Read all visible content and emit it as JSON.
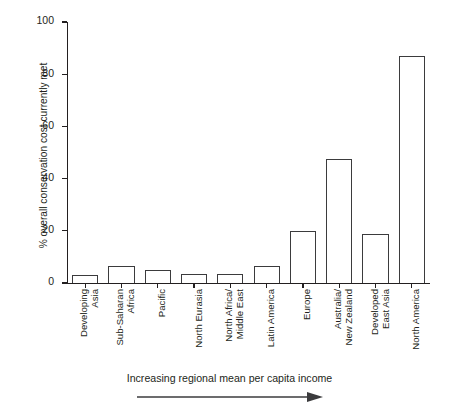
{
  "chart_data": {
    "type": "bar",
    "title": "",
    "subtitle": "",
    "xlabel": "Increasing regional mean per capita income",
    "ylabel": "% overall conservation cost currently met",
    "categories": [
      "Developing Asia",
      "Sub-Saharan Africa",
      "Pacific",
      "North Eurasia",
      "North Africa/ Middle East",
      "Latin America",
      "Europe",
      "Australia/ New Zealand",
      "Developed East Asia",
      "North America"
    ],
    "category_lines": [
      [
        "Developing",
        "Asia"
      ],
      [
        "Sub-Saharan",
        "Africa"
      ],
      [
        "Pacific"
      ],
      [
        "North Eurasia"
      ],
      [
        "North Africa/",
        "Middle East"
      ],
      [
        "Latin America"
      ],
      [
        "Europe"
      ],
      [
        "Australia/",
        "New Zealand"
      ],
      [
        "Developed",
        "East Asia"
      ],
      [
        "North America"
      ]
    ],
    "values": [
      3,
      6.5,
      5,
      3.5,
      3.5,
      6.5,
      20,
      47.5,
      18.8,
      87
    ],
    "ylim": [
      0,
      100
    ],
    "yticks": [
      0,
      20,
      40,
      60,
      80,
      100
    ],
    "ytick_labels": [
      "0",
      "20",
      "40",
      "60",
      "80",
      "100"
    ],
    "grid": false,
    "legend": false,
    "legend_position": "none",
    "bar_fill_color": "#ffffff",
    "bar_edge_color": "#3b3b3d",
    "axis_color": "#231f20",
    "text_color": "#231f20",
    "background_color": "#ffffff"
  },
  "annotations": {
    "arrow_label": "increasing-income-arrow",
    "arrow_direction": "right"
  }
}
